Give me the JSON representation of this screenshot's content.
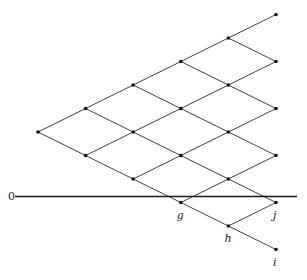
{
  "diagram": {
    "type": "binomial-lattice",
    "origin": {
      "x": 38,
      "y": 132
    },
    "step": {
      "dx": 47.6,
      "dy": 23.5
    },
    "levels": 5,
    "axis": {
      "label": "0",
      "y": 196.5,
      "x_start": 15,
      "x_end": 297,
      "label_x": 8,
      "label_y": 200
    },
    "labeled_nodes": [
      {
        "label": "g",
        "level": 3,
        "down": 3,
        "dx": -4,
        "dy": 16
      },
      {
        "label": "h",
        "level": 4,
        "down": 4,
        "dx": -4,
        "dy": 16
      },
      {
        "label": "j",
        "level": 5,
        "down": 4,
        "dx": -3,
        "dy": 16
      },
      {
        "label": "i",
        "level": 5,
        "down": 5,
        "dx": -3,
        "dy": 16
      }
    ],
    "colors": {
      "line": "#2a2a2a",
      "node": "#111111",
      "background": "#ffffff"
    }
  }
}
